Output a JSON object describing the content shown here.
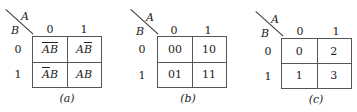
{
  "figure": {
    "maps": [
      {
        "id": "a",
        "caption": "(a)",
        "col_var": "A",
        "row_var": "B",
        "col_headers": [
          "0",
          "1"
        ],
        "row_headers": [
          "0",
          "1"
        ],
        "cells": [
          [
            {
              "parts": [
                {
                  "t": "A",
                  "bar": true
                },
                {
                  "t": "B",
                  "bar": true
                }
              ]
            },
            {
              "parts": [
                {
                  "t": "A",
                  "bar": false
                },
                {
                  "t": "B",
                  "bar": true
                }
              ]
            }
          ],
          [
            {
              "parts": [
                {
                  "t": "A",
                  "bar": true
                },
                {
                  "t": "B",
                  "bar": false
                }
              ]
            },
            {
              "parts": [
                {
                  "t": "A",
                  "bar": false
                },
                {
                  "t": "B",
                  "bar": false
                }
              ]
            }
          ]
        ],
        "cell_text": [
          [
            "ĀB̄",
            "AB̄"
          ],
          [
            "ĀB",
            "AB"
          ]
        ]
      },
      {
        "id": "b",
        "caption": "(b)",
        "col_var": "A",
        "row_var": "B",
        "col_headers": [
          "0",
          "1"
        ],
        "row_headers": [
          "0",
          "1"
        ],
        "cell_text": [
          [
            "00",
            "10"
          ],
          [
            "01",
            "11"
          ]
        ]
      },
      {
        "id": "c",
        "caption": "(c)",
        "col_var": "A",
        "row_var": "B",
        "col_headers": [
          "0",
          "1"
        ],
        "row_headers": [
          "0",
          "1"
        ],
        "cell_text": [
          [
            "0",
            "2"
          ],
          [
            "1",
            "3"
          ]
        ]
      }
    ]
  }
}
